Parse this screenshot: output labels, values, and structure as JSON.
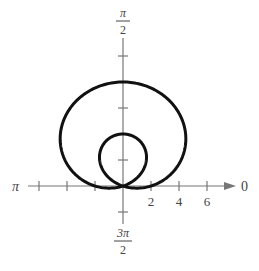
{
  "chart_data": {
    "type": "line",
    "subtype": "polar",
    "title": "",
    "equation": "r = 2 + 6 sin(theta)",
    "curve": {
      "name": "limacon with inner loop",
      "a": 2,
      "b": 6,
      "function": "sin",
      "color": "#111111"
    },
    "angle_labels": {
      "right": "0",
      "top": {
        "num": "π",
        "den": "2"
      },
      "left": "π",
      "bottom": {
        "num": "3π",
        "den": "2"
      }
    },
    "r_tick_labels": [
      "2",
      "4",
      "6"
    ],
    "r_ticks": [
      2,
      4,
      6
    ],
    "horizontal_ticks": [
      -6,
      -4,
      -2,
      2,
      4,
      6
    ],
    "vertical_ticks": [
      -2,
      2,
      4,
      6,
      8,
      10
    ],
    "xlim": [
      -7,
      8
    ],
    "ylim": [
      -3,
      11
    ],
    "grid": false,
    "legend": null,
    "key_points": [
      {
        "theta": "π/2",
        "r": 8
      },
      {
        "theta": "3π/2",
        "r": -4
      },
      {
        "theta": "0",
        "r": 2
      },
      {
        "theta": "π",
        "r": 2
      }
    ]
  },
  "layout": {
    "origin_px": [
      123,
      186
    ],
    "px_per_unit_x": 14,
    "px_per_unit_y": 13,
    "axis_color": "#777777"
  }
}
